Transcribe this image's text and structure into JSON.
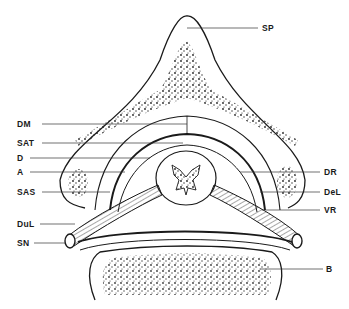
{
  "diagram": {
    "type": "anatomical cross-section (spinal canal)",
    "labels_left": [
      {
        "id": "DM",
        "text": "DM",
        "y": 124
      },
      {
        "id": "SAT",
        "text": "SAT",
        "y": 143
      },
      {
        "id": "D",
        "text": "D",
        "y": 158
      },
      {
        "id": "A",
        "text": "A",
        "y": 172
      },
      {
        "id": "SAS",
        "text": "SAS",
        "y": 192
      },
      {
        "id": "DuL",
        "text": "DuL",
        "y": 224
      },
      {
        "id": "SN",
        "text": "SN",
        "y": 243
      }
    ],
    "labels_right": [
      {
        "id": "SP",
        "text": "SP",
        "y": 28
      },
      {
        "id": "DR",
        "text": "DR",
        "y": 172
      },
      {
        "id": "DeL",
        "text": "DeL",
        "y": 192
      },
      {
        "id": "VR",
        "text": "VR",
        "y": 210
      },
      {
        "id": "B",
        "text": "B",
        "y": 269
      }
    ],
    "colors": {
      "ink": "#1a1a1a",
      "background": "#ffffff",
      "stipple": "#2a2a2a"
    }
  }
}
